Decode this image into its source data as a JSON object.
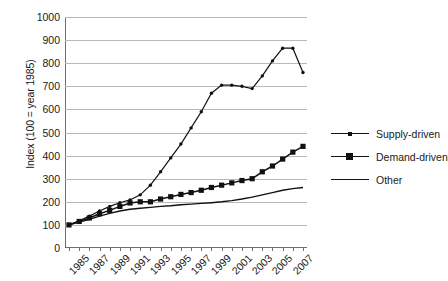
{
  "chart_data": {
    "type": "line",
    "title": "",
    "xlabel": "",
    "ylabel": "Index (100 = year 1985)",
    "ylim": [
      0,
      1000
    ],
    "ytick_labels": [
      "0",
      "100",
      "200",
      "300",
      "400",
      "500",
      "600",
      "700",
      "800",
      "900",
      "1000"
    ],
    "ytick_values": [
      0,
      100,
      200,
      300,
      400,
      500,
      600,
      700,
      800,
      900,
      1000
    ],
    "grid": "horizontal",
    "legend_position": "right",
    "x": [
      1985,
      1986,
      1987,
      1988,
      1989,
      1990,
      1991,
      1992,
      1993,
      1994,
      1995,
      1996,
      1997,
      1998,
      1999,
      2000,
      2001,
      2002,
      2003,
      2004,
      2005,
      2006,
      2007,
      2008
    ],
    "xtick_labels": [
      "1985",
      "1987",
      "1989",
      "1991",
      "1993",
      "1995",
      "1997",
      "1999",
      "2001",
      "2003",
      "2005",
      "2007"
    ],
    "xtick_values": [
      1985,
      1987,
      1989,
      1991,
      1993,
      1995,
      1997,
      1999,
      2001,
      2003,
      2005,
      2007
    ],
    "series": [
      {
        "name": "Supply-driven",
        "marker": "small-dot",
        "values": [
          100,
          118,
          138,
          160,
          180,
          196,
          208,
          230,
          272,
          330,
          390,
          450,
          520,
          590,
          670,
          705,
          705,
          700,
          690,
          745,
          810,
          865,
          865,
          760
        ]
      },
      {
        "name": "Demand-driven",
        "marker": "square",
        "values": [
          100,
          115,
          130,
          148,
          163,
          180,
          195,
          200,
          200,
          212,
          222,
          232,
          240,
          250,
          262,
          272,
          282,
          292,
          300,
          330,
          355,
          385,
          415,
          440
        ]
      },
      {
        "name": "Other",
        "marker": "none",
        "values": [
          100,
          112,
          124,
          138,
          150,
          160,
          168,
          172,
          176,
          180,
          183,
          187,
          190,
          193,
          196,
          200,
          205,
          212,
          220,
          230,
          240,
          250,
          257,
          262
        ]
      }
    ]
  },
  "legend": {
    "items": [
      {
        "label": "Supply-driven"
      },
      {
        "label": "Demand-driven"
      },
      {
        "label": "Other"
      }
    ]
  },
  "colors": {
    "series": "#111111",
    "gridline": "#b9b9b9",
    "axis": "#6e6e6e",
    "background": "#ffffff"
  }
}
